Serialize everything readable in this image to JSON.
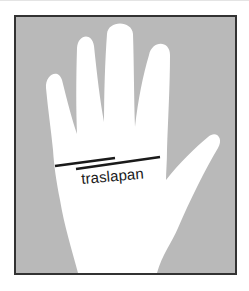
{
  "figure": {
    "label": "traslapan",
    "colors": {
      "background": "#b9b9b9",
      "hand": "#ffffff",
      "frame": "#333333",
      "lines": "#1a1a1a"
    },
    "lines": [
      {
        "name": "upper-line",
        "x1": 55,
        "y1": 166,
        "x2": 115,
        "y2": 158
      },
      {
        "name": "lower-line",
        "x1": 76,
        "y1": 169,
        "x2": 160,
        "y2": 157
      }
    ]
  }
}
